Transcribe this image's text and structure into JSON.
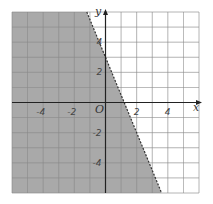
{
  "chart_data": {
    "type": "inequality-region",
    "title": "",
    "xlabel": "x",
    "ylabel": "y",
    "origin_label": "O",
    "xlim": [
      -6,
      6
    ],
    "ylim": [
      -6,
      6
    ],
    "grid": true,
    "grid_step": 1,
    "x_ticks": [
      {
        "value": -4,
        "label": "-4"
      },
      {
        "value": -2,
        "label": "-2"
      },
      {
        "value": 2,
        "label": "2"
      },
      {
        "value": 4,
        "label": "4"
      }
    ],
    "y_ticks": [
      {
        "value": 4,
        "label": "4"
      },
      {
        "value": 2,
        "label": "2"
      },
      {
        "value": -2,
        "label": "-2"
      },
      {
        "value": -4,
        "label": "-4"
      }
    ],
    "boundary_line": {
      "equation": "y = -2.5x + 3",
      "style": "dashed",
      "points": [
        [
          -1.2,
          6
        ],
        [
          3.6,
          -6
        ]
      ],
      "y_intercept": 3,
      "x_intercept": 1.2
    },
    "shaded_region": "left of / below the line (y < -2.5x + 3)",
    "colors": {
      "shade": "#a9a9a9",
      "grid": "#555555",
      "grid_white": "#8a8a8a",
      "axis": "#222222"
    }
  }
}
